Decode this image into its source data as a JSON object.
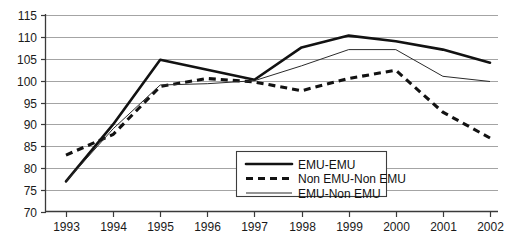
{
  "chart_data": {
    "type": "line",
    "title": "",
    "subtitle": "",
    "xlabel": "",
    "ylabel": "",
    "categories": [
      "1993",
      "1994",
      "1995",
      "1996",
      "1997",
      "1998",
      "1999",
      "2000",
      "2001",
      "2002"
    ],
    "x": [
      1993,
      1994,
      1995,
      1996,
      1997,
      1998,
      1999,
      2000,
      2001,
      2002
    ],
    "xlim": [
      1993,
      2002
    ],
    "ylim": [
      70,
      115
    ],
    "yticks": [
      70,
      75,
      80,
      85,
      90,
      95,
      100,
      105,
      110,
      115
    ],
    "ytick_labels": [
      "70",
      "75",
      "80",
      "85",
      "90",
      "95",
      "100",
      "105",
      "110",
      "115"
    ],
    "grid": true,
    "legend_position": "lower-center",
    "series": [
      {
        "name": "EMU-EMU",
        "style": "thick-solid",
        "color": "#121212",
        "values": [
          77.0,
          90.0,
          104.8,
          102.5,
          100.2,
          107.6,
          110.3,
          109.0,
          107.1,
          104.1
        ]
      },
      {
        "name": "Non EMU-Non EMU",
        "style": "thick-dashed",
        "color": "#121212",
        "values": [
          83.0,
          87.7,
          98.7,
          100.5,
          99.7,
          97.7,
          100.5,
          102.4,
          92.8,
          86.9
        ]
      },
      {
        "name": "EMU-Non EMU",
        "style": "thin-solid",
        "color": "#2b2b2b",
        "values": [
          77.0,
          89.0,
          99.0,
          99.3,
          100.0,
          103.4,
          107.1,
          107.1,
          101.0,
          99.8
        ]
      }
    ]
  },
  "legend": {
    "entries": [
      {
        "label": "EMU-EMU"
      },
      {
        "label": "Non EMU-Non EMU"
      },
      {
        "label": "EMU-Non EMU"
      }
    ]
  },
  "colors": {
    "background": "#ffffff",
    "grid": "#8d8d8d",
    "axis": "#3a3a3a",
    "ink": "#121212"
  }
}
